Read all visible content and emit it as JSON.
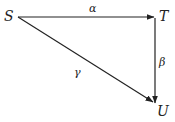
{
  "diagram": {
    "type": "commutative-triangle",
    "nodes": [
      {
        "id": "S",
        "label": "S"
      },
      {
        "id": "T",
        "label": "T"
      },
      {
        "id": "U",
        "label": "U"
      }
    ],
    "edges": [
      {
        "from": "S",
        "to": "T",
        "label": "α"
      },
      {
        "from": "T",
        "to": "U",
        "label": "β"
      },
      {
        "from": "S",
        "to": "U",
        "label": "γ"
      }
    ],
    "color": "#222222"
  }
}
